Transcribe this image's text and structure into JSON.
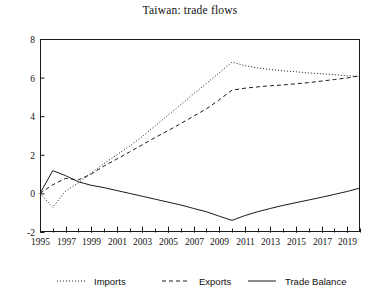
{
  "chart_data": {
    "type": "line",
    "title": "Taiwan: trade flows",
    "xlabel": "",
    "ylabel": "",
    "xlim": [
      1995,
      2020
    ],
    "ylim": [
      -2,
      8
    ],
    "yticks": [
      -2,
      0,
      2,
      4,
      6,
      8
    ],
    "ytick_labels": [
      "2",
      "0",
      "2",
      "4",
      "6",
      "8"
    ],
    "ytick_labels_signed": [
      "-2",
      "0",
      "2",
      "4",
      "6",
      "8"
    ],
    "xticks": [
      1995,
      1997,
      1999,
      2001,
      2003,
      2005,
      2007,
      2009,
      2011,
      2013,
      2015,
      2017,
      2019
    ],
    "xtick_labels": [
      "1995",
      "1997",
      "1999",
      "2001",
      "2003",
      "2005",
      "2007",
      "2009",
      "2011",
      "2013",
      "2015",
      "2017",
      "2019"
    ],
    "xminor_step": 1,
    "grid": false,
    "legend_position": "bottom",
    "x": [
      1995,
      1996,
      1997,
      1998,
      1999,
      2000,
      2001,
      2002,
      2003,
      2004,
      2005,
      2006,
      2007,
      2008,
      2009,
      2010,
      2011,
      2012,
      2013,
      2014,
      2015,
      2016,
      2017,
      2018,
      2019,
      2020
    ],
    "series": [
      {
        "name": "Imports",
        "style": "dotted",
        "color": "#1a1a1a",
        "values": [
          0.0,
          -0.72,
          0.12,
          0.55,
          1.05,
          1.55,
          2.0,
          2.45,
          2.95,
          3.5,
          4.05,
          4.6,
          5.15,
          5.7,
          6.25,
          6.8,
          6.62,
          6.5,
          6.42,
          6.35,
          6.3,
          6.24,
          6.2,
          6.15,
          6.1,
          6.05
        ]
      },
      {
        "name": "Exports",
        "style": "dashed",
        "color": "#1a1a1a",
        "values": [
          0.0,
          0.45,
          0.78,
          0.7,
          1.0,
          1.42,
          1.78,
          2.15,
          2.52,
          2.9,
          3.25,
          3.62,
          4.0,
          4.38,
          4.85,
          5.35,
          5.45,
          5.52,
          5.58,
          5.62,
          5.68,
          5.74,
          5.82,
          5.9,
          5.98,
          6.1
        ]
      },
      {
        "name": "Trade Balance",
        "style": "solid",
        "color": "#1a1a1a",
        "values": [
          0.0,
          1.18,
          0.92,
          0.6,
          0.42,
          0.3,
          0.15,
          0.0,
          -0.15,
          -0.3,
          -0.45,
          -0.6,
          -0.78,
          -0.95,
          -1.18,
          -1.4,
          -1.15,
          -0.95,
          -0.78,
          -0.62,
          -0.48,
          -0.34,
          -0.2,
          -0.05,
          0.1,
          0.28
        ]
      }
    ]
  },
  "legend": {
    "items": [
      {
        "label": "Imports",
        "style": "dotted"
      },
      {
        "label": "Exports",
        "style": "dashed"
      },
      {
        "label": "Trade Balance",
        "style": "solid"
      }
    ]
  }
}
